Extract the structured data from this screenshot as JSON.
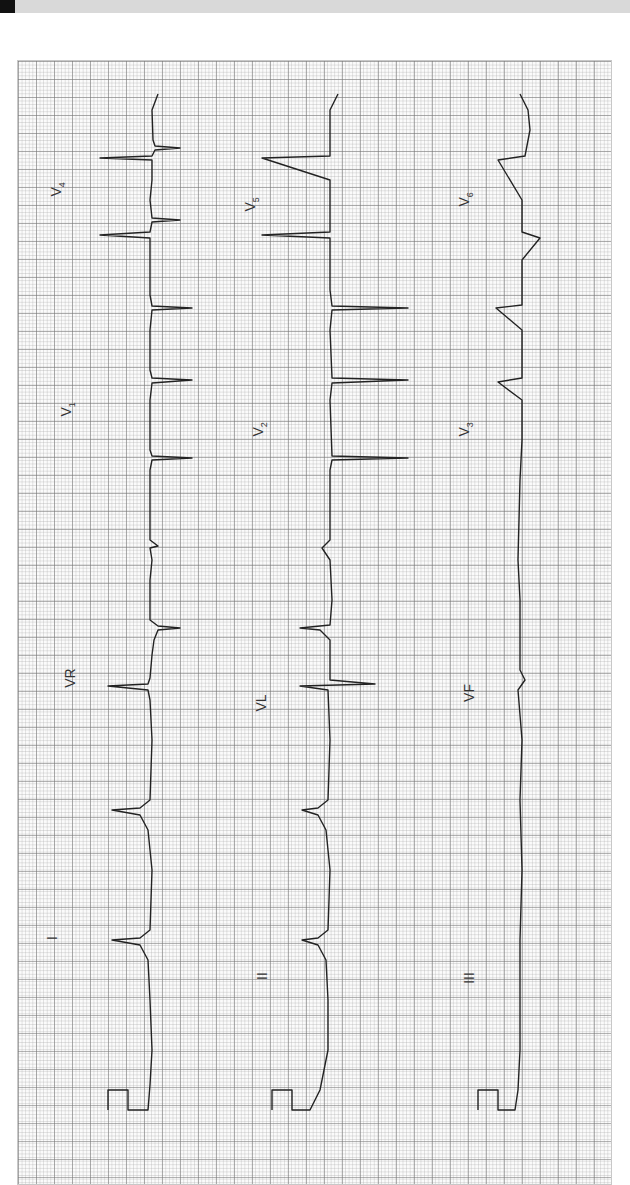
{
  "document": {
    "type": "12-lead ECG printout (rotated 90° counter-clockwise)",
    "grid_color": "#888888",
    "trace_color": "#222222",
    "paper_color": "#fbfbfb"
  },
  "leads": {
    "row1": [
      "I",
      "VR",
      "V1",
      "V4"
    ],
    "row2": [
      "II",
      "VL",
      "V2",
      "V5"
    ],
    "row3": [
      "III",
      "VF",
      "V3",
      "V6"
    ]
  },
  "labels": {
    "I": "I",
    "II": "II",
    "III": "III",
    "VR": "VR",
    "VL": "VL",
    "VF": "VF",
    "V1": "V",
    "V1_sub": "1",
    "V2": "V",
    "V2_sub": "2",
    "V3": "V",
    "V3_sub": "3",
    "V4": "V",
    "V4_sub": "4",
    "V5": "V",
    "V5_sub": "5",
    "V6": "V",
    "V6_sub": "6"
  }
}
